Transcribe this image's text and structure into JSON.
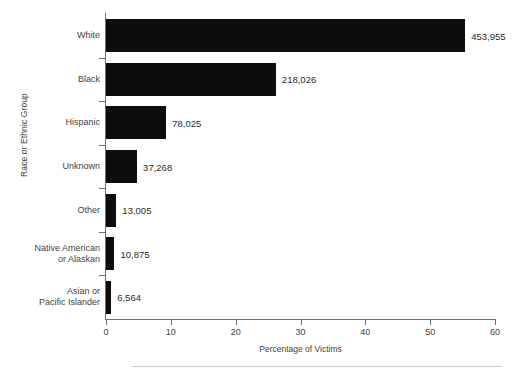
{
  "chart_data": {
    "type": "bar",
    "orientation": "horizontal",
    "title": "",
    "xlabel": "Percentage of Victims",
    "ylabel": "Race or Ethnic Group",
    "xlim": [
      0,
      60
    ],
    "xticks": [
      0,
      10,
      20,
      30,
      40,
      50,
      60
    ],
    "grid": false,
    "legend": null,
    "bar_color": "#0d0d0d",
    "categories": [
      "White",
      "Black",
      "Hispanic",
      "Unknown",
      "Other",
      "Native American\nor Alaskan",
      "Asian or\nPacific Islander"
    ],
    "values": [
      55.4,
      26.2,
      9.3,
      4.8,
      1.6,
      1.3,
      0.8
    ],
    "data_labels": [
      "453,955",
      "218,026",
      "78,025",
      "37,268",
      "13,005",
      "10,875",
      "6,564"
    ],
    "counts": [
      453955,
      218026,
      78025,
      37268,
      13005,
      10875,
      6564
    ]
  }
}
